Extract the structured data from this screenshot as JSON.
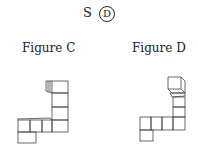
{
  "header": {
    "prefix": "S",
    "circled": "D"
  },
  "figures": [
    {
      "label": "Figure C"
    },
    {
      "label": "Figure D"
    }
  ]
}
